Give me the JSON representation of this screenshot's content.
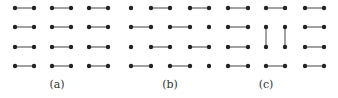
{
  "figure": {
    "dot_color": "#222222",
    "edge_color": "#555555",
    "dot_radius": 2.2,
    "panels": [
      {
        "label": "(a)",
        "label_x": 57,
        "label_y": 88,
        "cols": [
          15,
          34,
          52,
          71,
          89,
          108
        ],
        "rows": [
          8,
          27,
          47,
          66
        ],
        "edges": [
          [
            0,
            0,
            1,
            0
          ],
          [
            2,
            0,
            3,
            0
          ],
          [
            4,
            0,
            5,
            0
          ],
          [
            0,
            1,
            1,
            1
          ],
          [
            2,
            1,
            3,
            1
          ],
          [
            4,
            1,
            5,
            1
          ],
          [
            0,
            2,
            1,
            2
          ],
          [
            2,
            2,
            3,
            2
          ],
          [
            4,
            2,
            5,
            2
          ],
          [
            0,
            3,
            1,
            3
          ],
          [
            2,
            3,
            3,
            3
          ],
          [
            4,
            3,
            5,
            3
          ]
        ]
      },
      {
        "label": "(b)",
        "label_x": 170,
        "label_y": 88,
        "cols": [
          131,
          151,
          170,
          190,
          209,
          228
        ],
        "rows": [
          8,
          27,
          47,
          66
        ],
        "edges": [
          [
            1,
            0,
            2,
            0
          ],
          [
            3,
            0,
            4,
            0
          ],
          [
            0,
            1,
            1,
            1
          ],
          [
            2,
            1,
            3,
            1
          ],
          [
            1,
            2,
            2,
            2
          ],
          [
            3,
            2,
            4,
            2
          ],
          [
            0,
            3,
            1,
            3
          ],
          [
            2,
            3,
            3,
            3
          ]
        ],
        "hide_col": 5
      },
      {
        "label": "(c)",
        "label_x": 266,
        "label_y": 88,
        "cols": [
          228,
          248,
          266,
          285,
          305,
          324
        ],
        "rows": [
          8,
          27,
          47,
          66
        ],
        "edges": [
          [
            0,
            0,
            1,
            0
          ],
          [
            2,
            0,
            3,
            0
          ],
          [
            4,
            0,
            5,
            0
          ],
          [
            0,
            1,
            1,
            1
          ],
          [
            4,
            1,
            5,
            1
          ],
          [
            2,
            1,
            2,
            2
          ],
          [
            3,
            1,
            3,
            2
          ],
          [
            0,
            2,
            1,
            2
          ],
          [
            4,
            2,
            5,
            2
          ],
          [
            0,
            3,
            1,
            3
          ],
          [
            2,
            3,
            3,
            3
          ],
          [
            4,
            3,
            5,
            3
          ]
        ]
      }
    ]
  }
}
